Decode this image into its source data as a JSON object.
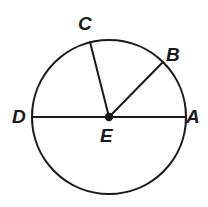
{
  "figure": {
    "kind": "circle-geometry-diagram",
    "background_color": "#ffffff",
    "stroke_color": "#1a1a1a",
    "label_color": "#1a1a1a",
    "circle": {
      "center_x": 109,
      "center_y": 117,
      "radius": 77,
      "stroke_width": 2.1
    },
    "center_dot": {
      "x": 109,
      "y": 117,
      "radius": 4.2
    },
    "segments": [
      {
        "name": "diameter-DA",
        "from": "D",
        "to": "A",
        "x1": 32,
        "y1": 117,
        "x2": 186,
        "y2": 117,
        "stroke_width": 2.0
      },
      {
        "name": "radius-EC",
        "from": "E",
        "to": "C",
        "x1": 109,
        "y1": 117,
        "x2": 90,
        "y2": 42,
        "stroke_width": 2.0
      },
      {
        "name": "radius-EB",
        "from": "E",
        "to": "B",
        "x1": 109,
        "y1": 117,
        "x2": 163,
        "y2": 62,
        "stroke_width": 2.0
      }
    ],
    "labels": [
      {
        "id": "A",
        "text": "A",
        "x": 186,
        "y": 107
      },
      {
        "id": "B",
        "text": "B",
        "x": 166,
        "y": 45
      },
      {
        "id": "C",
        "text": "C",
        "x": 78,
        "y": 14
      },
      {
        "id": "D",
        "text": "D",
        "x": 12,
        "y": 107
      },
      {
        "id": "E",
        "text": "E",
        "x": 100,
        "y": 126
      }
    ]
  }
}
